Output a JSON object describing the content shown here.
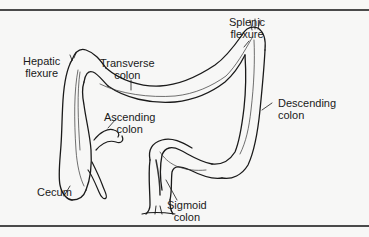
{
  "figure": {
    "colors": {
      "background": "#f7f7f6",
      "ink": "#1a1a1a",
      "rule": "#4a4a4a"
    },
    "labels": {
      "splenic_flexure": {
        "line1": "Splenic",
        "line2": "flexure"
      },
      "hepatic_flexure": {
        "line1": "Hepatic",
        "line2": "flexure"
      },
      "transverse_colon": {
        "line1": "Transverse",
        "line2": "colon"
      },
      "descending_colon": {
        "line1": "Descending",
        "line2": "colon"
      },
      "ascending_colon": {
        "line1": "Ascending",
        "line2": "colon"
      },
      "cecum": {
        "line1": "Cecum"
      },
      "sigmoid_colon": {
        "line1": "Sigmoid",
        "line2": "colon"
      }
    }
  }
}
